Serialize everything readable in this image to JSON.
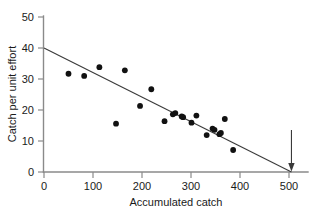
{
  "chart_data": {
    "type": "scatter",
    "title": "",
    "xlabel": "Accumulated catch",
    "ylabel": "Catch per unit effort",
    "xlim": [
      0,
      540
    ],
    "ylim": [
      0,
      50
    ],
    "xticks": [
      0,
      100,
      200,
      300,
      400,
      500
    ],
    "yticks": [
      0,
      10,
      20,
      30,
      40,
      50
    ],
    "xtick_labels": [
      "0",
      "100",
      "200",
      "300",
      "400",
      "500"
    ],
    "ytick_labels": [
      "0",
      "10",
      "20",
      "30",
      "40",
      "50"
    ],
    "grid": false,
    "legend": false,
    "points": [
      {
        "x": 50,
        "y": 31.7
      },
      {
        "x": 82,
        "y": 31.0
      },
      {
        "x": 113,
        "y": 33.8
      },
      {
        "x": 147,
        "y": 15.6
      },
      {
        "x": 165,
        "y": 32.8
      },
      {
        "x": 196,
        "y": 21.3
      },
      {
        "x": 219,
        "y": 26.7
      },
      {
        "x": 246,
        "y": 16.4
      },
      {
        "x": 263,
        "y": 18.6
      },
      {
        "x": 268,
        "y": 19.0
      },
      {
        "x": 281,
        "y": 17.9
      },
      {
        "x": 284,
        "y": 17.7
      },
      {
        "x": 301,
        "y": 15.9
      },
      {
        "x": 311,
        "y": 18.2
      },
      {
        "x": 332,
        "y": 11.9
      },
      {
        "x": 344,
        "y": 14.0
      },
      {
        "x": 348,
        "y": 13.6
      },
      {
        "x": 358,
        "y": 12.2
      },
      {
        "x": 361,
        "y": 12.6
      },
      {
        "x": 369,
        "y": 17.1
      },
      {
        "x": 386,
        "y": 7.1
      }
    ],
    "fit_line": {
      "name": "linear regression",
      "x0": 0,
      "y0": 40.0,
      "x1": 505,
      "y1": 0.0,
      "intercept": 40.0,
      "slope": -0.0792
    },
    "annotations": [
      {
        "name": "x-intercept-arrow",
        "type": "down-arrow",
        "x": 505,
        "y": 0,
        "label": ""
      }
    ]
  }
}
